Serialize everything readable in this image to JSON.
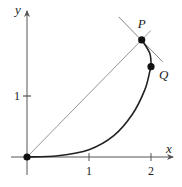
{
  "diagram": {
    "axes": {
      "x_label": "x",
      "y_label": "y",
      "x_ticks": [
        {
          "value": 1,
          "label": "1"
        },
        {
          "value": 2,
          "label": "2"
        }
      ],
      "y_ticks": [
        {
          "value": 1,
          "label": "1"
        }
      ]
    },
    "points": [
      {
        "name": "O",
        "label": "",
        "x": 0,
        "y": 0
      },
      {
        "name": "P",
        "label": "P",
        "x": 1.85,
        "y": 1.92
      },
      {
        "name": "Q",
        "label": "Q",
        "x": 2.0,
        "y": 1.48
      }
    ],
    "curve": {
      "description": "curve from origin rising to P, becoming near-vertical around x=2, passing through Q",
      "samples": [
        [
          0,
          0
        ],
        [
          0.5,
          0.02
        ],
        [
          1.0,
          0.12
        ],
        [
          1.4,
          0.35
        ],
        [
          1.7,
          0.7
        ],
        [
          1.9,
          1.1
        ],
        [
          1.98,
          1.4
        ],
        [
          2.0,
          1.48
        ],
        [
          1.98,
          1.7
        ],
        [
          1.85,
          1.92
        ]
      ]
    },
    "tangent_line": {
      "through": "P",
      "description": "line tangent to the curve at P"
    },
    "chord": {
      "from": "O",
      "to": "P",
      "description": "secant line from origin through P"
    },
    "colors": {
      "axis": "#555555",
      "curve": "#222222",
      "thin_line": "#888888",
      "point": "#111111"
    }
  }
}
